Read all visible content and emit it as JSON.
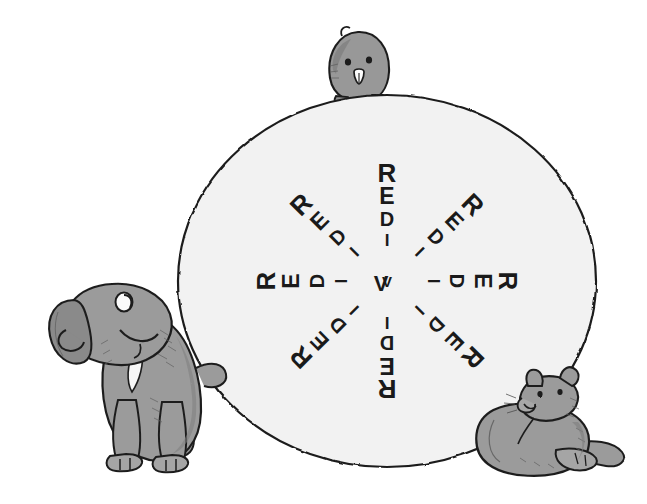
{
  "illustration": {
    "title": "Redivider palindrome wheel with three animals",
    "background_color": "#ffffff",
    "disc": {
      "label": "word-disc",
      "fill": "#f2f2f2",
      "stroke": "#1c1c1c",
      "center_x": 387,
      "center_y": 281,
      "radius_x": 209,
      "radius_y": 186
    },
    "ink_color": "#1a1a1a",
    "animal_fill": "#9a9a9a",
    "animal_shade": "#868686",
    "animal_stroke": "#1c1c1c"
  },
  "word": {
    "text": "REDIVIDER",
    "letters": [
      "R",
      "E",
      "D",
      "I",
      "V",
      "I",
      "D",
      "E",
      "R"
    ],
    "is_palindrome": true,
    "repeat_count": 8
  },
  "spokes": [
    {
      "name": "spoke-north",
      "angle_deg": -90,
      "label": "REDIVIDER"
    },
    {
      "name": "spoke-northeast",
      "angle_deg": -45,
      "label": "REDIVIDER"
    },
    {
      "name": "spoke-east",
      "angle_deg": 0,
      "label": "REDIVIDER"
    },
    {
      "name": "spoke-southeast",
      "angle_deg": 45,
      "label": "REDIVIDER"
    },
    {
      "name": "spoke-south",
      "angle_deg": 90,
      "label": "REDIVIDER"
    },
    {
      "name": "spoke-southwest",
      "angle_deg": 135,
      "label": "REDIVIDER"
    },
    {
      "name": "spoke-west",
      "angle_deg": 180,
      "label": "REDIVIDER"
    },
    {
      "name": "spoke-northwest",
      "angle_deg": 225,
      "label": "REDIVIDER"
    }
  ],
  "animals": [
    {
      "name": "rodent-top",
      "species": "hamster",
      "position": "top-center",
      "x": 357,
      "y": 62,
      "pose": "peeking over the disc"
    },
    {
      "name": "dog-left",
      "species": "puppy",
      "position": "left",
      "x": 120,
      "y": 370,
      "pose": "sitting, looking up"
    },
    {
      "name": "cat-bottom-right",
      "species": "cat",
      "position": "bottom-right",
      "x": 552,
      "y": 425,
      "pose": "lying down, looking up-left"
    }
  ]
}
